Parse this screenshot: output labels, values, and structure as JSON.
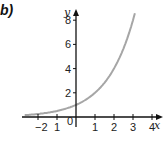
{
  "panel": {
    "label": "b)"
  },
  "chart_data": {
    "type": "line",
    "title": "",
    "xlabel": "x",
    "ylabel": "y",
    "xlim": [
      -2.7,
      4.5
    ],
    "ylim": [
      0,
      9
    ],
    "grid": false,
    "x_ticks": [
      "-2",
      "1",
      "0",
      "1",
      "2",
      "3",
      "4"
    ],
    "x_tick_values": [
      -2,
      -1,
      0,
      1,
      2,
      3,
      4
    ],
    "y_ticks": [
      "2",
      "4",
      "6",
      "8"
    ],
    "y_tick_values": [
      2,
      4,
      6,
      8
    ],
    "series": [
      {
        "name": "y = 2^x",
        "color": "#a6a6a6",
        "x": [
          -2.7,
          -2,
          -1,
          0,
          1,
          2,
          2.5,
          3,
          3.1
        ],
        "y": [
          0.15,
          0.25,
          0.5,
          1,
          2,
          4,
          5.66,
          8,
          8.57
        ]
      }
    ],
    "legend": null
  },
  "colors": {
    "axis": "#111111",
    "curve": "#a6a6a6"
  }
}
